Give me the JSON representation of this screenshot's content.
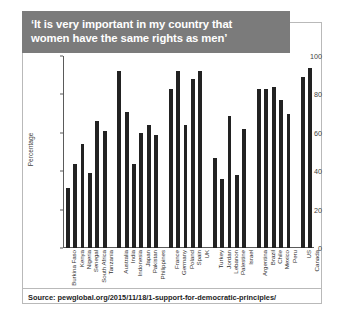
{
  "figure": {
    "title_line1": "‘It is very important in my country that",
    "title_line2": "women have the same rights as men’",
    "source_text": "Source: pewglobal.org/2015/11/18/1-support-for-democratic-principles/",
    "banner_color": "#7b7b7b",
    "bar_color": "#222222",
    "frame_color": "#b9b9b9"
  },
  "chart_data": {
    "type": "bar",
    "title": "‘It is very important in my country that women have the same rights as men’",
    "xlabel": "",
    "ylabel": "Percentage",
    "ylim": [
      0,
      100
    ],
    "yticks": [
      0,
      20,
      40,
      60,
      80,
      100
    ],
    "ytick_labels": [
      "0",
      "20",
      "40",
      "60",
      "80",
      "100"
    ],
    "grid": false,
    "legend": "none",
    "categories": [
      "Burkina Faso",
      "Kenya",
      "Nigeria",
      "Senegal",
      "South Africa",
      "Tanzania",
      "Australia",
      "India",
      "Indonesia",
      "Japan",
      "Pakistan",
      "Philippines",
      "France",
      "Germany",
      "Poland",
      "Spain",
      "UK",
      "Turkey",
      "Jordan",
      "Lebanon",
      "Palestine",
      "Israel",
      "Argentina",
      "Brazil",
      "Chile",
      "Mexico",
      "Peru",
      "US",
      "Canada"
    ],
    "values": [
      31,
      44,
      54,
      39,
      66,
      61,
      92,
      71,
      44,
      60,
      64,
      59,
      83,
      92,
      64,
      88,
      92,
      47,
      36,
      69,
      38,
      62,
      83,
      83,
      84,
      77,
      70,
      89,
      94
    ],
    "group_breaks_after": [
      5,
      11,
      16,
      21,
      26
    ]
  }
}
